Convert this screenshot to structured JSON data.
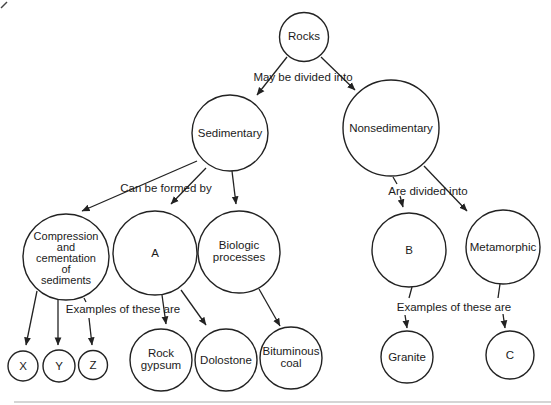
{
  "diagram": {
    "type": "concept-map",
    "topic": "Classification of rocks"
  },
  "nodes": {
    "rocks": {
      "label": "Rocks"
    },
    "sedimentary": {
      "label": "Sedimentary"
    },
    "nonsedimentary": {
      "label": "Nonsedimentary"
    },
    "compression": {
      "lines": [
        "Compression",
        "and",
        "cementation",
        "of",
        "sediments"
      ]
    },
    "a": {
      "label": "A"
    },
    "biologic": {
      "lines": [
        "Biologic",
        "processes"
      ]
    },
    "x": {
      "label": "X"
    },
    "y": {
      "label": "Y"
    },
    "z": {
      "label": "Z"
    },
    "rock_gypsum": {
      "lines": [
        "Rock",
        "gypsum"
      ]
    },
    "dolostone": {
      "label": "Dolostone"
    },
    "bituminous_coal": {
      "lines": [
        "Bituminous",
        "coal"
      ]
    },
    "b": {
      "label": "B"
    },
    "metamorphic": {
      "label": "Metamorphic"
    },
    "granite": {
      "label": "Granite"
    },
    "c": {
      "label": "C"
    }
  },
  "edge_labels": {
    "may_be_divided_into": "May be divided into",
    "can_be_formed_by": "Can be formed by",
    "are_divided_into": "Are divided into",
    "examples_left": "Examples of these are",
    "examples_right": "Examples of these are"
  },
  "colors": {
    "ink": "#222222",
    "background": "#ffffff"
  }
}
